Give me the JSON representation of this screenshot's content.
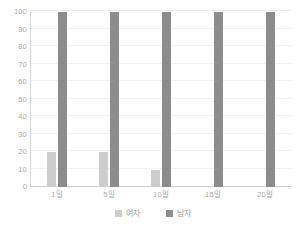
{
  "chart_data": {
    "type": "bar",
    "title": "",
    "subtitle": "",
    "xlabel": "",
    "ylabel": "",
    "categories": [
      "1일",
      "5일",
      "10일",
      "15일",
      "20일"
    ],
    "series": [
      {
        "name": "여자",
        "color": "#cdcdcd",
        "values": [
          20,
          20,
          10,
          0,
          0
        ]
      },
      {
        "name": "남자",
        "color": "#8d8d8d",
        "values": [
          100,
          100,
          100,
          100,
          100
        ]
      }
    ],
    "ylim": [
      0,
      100
    ],
    "ytick_step": 10,
    "yticks": [
      "100",
      "90",
      "80",
      "70",
      "60",
      "50",
      "40",
      "30",
      "20",
      "10",
      "0"
    ],
    "grid": true,
    "grid_axis": "y",
    "legend_position": "bottom-center",
    "background_color": "#ffffff",
    "axis_color": "#d0d0d0",
    "grid_color": "#f2f2f2",
    "tick_label_color": "#a8a8a8"
  }
}
